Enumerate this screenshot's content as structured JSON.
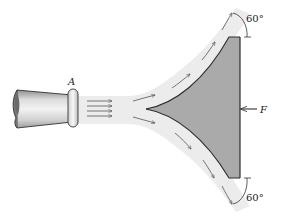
{
  "diagram": {
    "labels": {
      "nozzle": "A",
      "force": "F",
      "angle_top": "60°",
      "angle_bottom": "60°"
    },
    "colors": {
      "vane_fill": "#a9a9a9",
      "jet_fill": "#ebebeb",
      "line": "#333333",
      "nozzle_light": "#e6e6e6",
      "nozzle_dark": "#9a9a9a"
    }
  }
}
